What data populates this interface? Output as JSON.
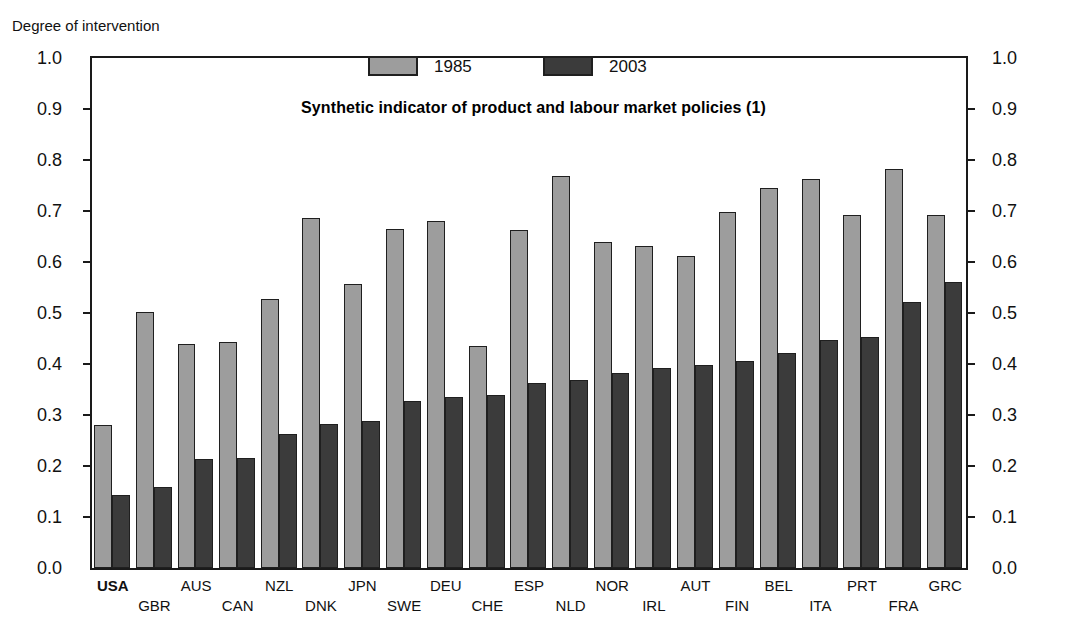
{
  "axis_caption": "Degree of intervention",
  "subtitle": "Synthetic indicator of product and labour market policies (1)",
  "legend": {
    "items": [
      {
        "label": "1985",
        "color": "#9d9d9d"
      },
      {
        "label": "2003",
        "color": "#3b3b3b"
      }
    ]
  },
  "y_axis": {
    "ticks": [
      "1.0",
      "0.9",
      "0.8",
      "0.7",
      "0.6",
      "0.5",
      "0.4",
      "0.3",
      "0.2",
      "0.1",
      "0.0"
    ],
    "min": 0.0,
    "max": 1.0
  },
  "chart_data": {
    "type": "bar",
    "title": "Synthetic indicator of product and labour market policies (1)",
    "xlabel": "",
    "ylabel": "Degree of intervention",
    "ylim": [
      0.0,
      1.0
    ],
    "grid": false,
    "legend_position": "top-center",
    "categories": [
      "USA",
      "GBR",
      "AUS",
      "CAN",
      "NZL",
      "DNK",
      "JPN",
      "SWE",
      "DEU",
      "CHE",
      "ESP",
      "NLD",
      "NOR",
      "IRL",
      "AUT",
      "FIN",
      "BEL",
      "ITA",
      "PRT",
      "FRA",
      "GRC"
    ],
    "highlighted_category": "USA",
    "series": [
      {
        "name": "1985",
        "color": "#9d9d9d",
        "values": [
          0.281,
          0.502,
          0.44,
          0.444,
          0.527,
          0.686,
          0.556,
          0.664,
          0.681,
          0.435,
          0.662,
          0.768,
          0.639,
          0.631,
          0.611,
          0.699,
          0.746,
          0.762,
          0.693,
          0.783,
          0.693
        ]
      },
      {
        "name": "2003",
        "color": "#3b3b3b",
        "values": [
          0.144,
          0.158,
          0.213,
          0.216,
          0.262,
          0.283,
          0.288,
          0.327,
          0.336,
          0.34,
          0.363,
          0.369,
          0.382,
          0.393,
          0.398,
          0.406,
          0.422,
          0.447,
          0.453,
          0.521,
          0.56
        ]
      }
    ]
  }
}
